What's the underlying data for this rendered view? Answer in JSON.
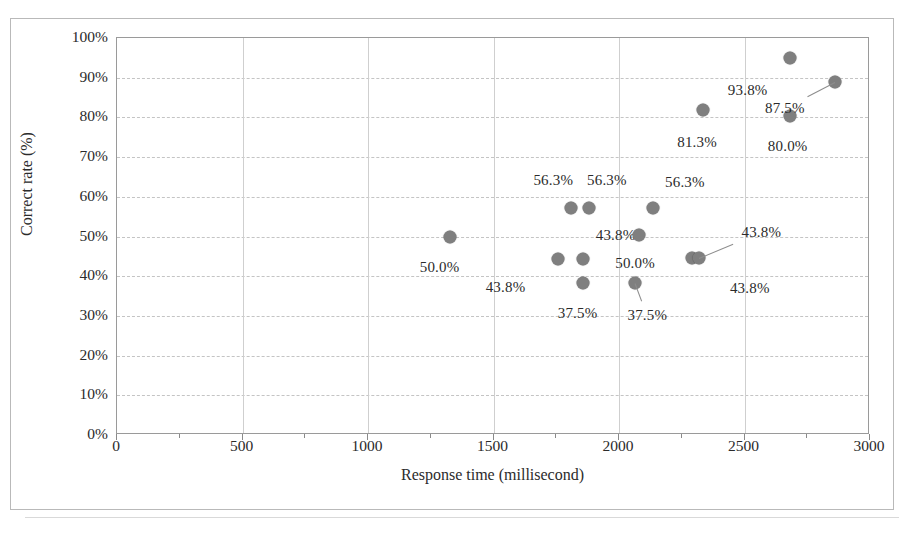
{
  "chart_data": {
    "type": "scatter",
    "title": "",
    "xlabel": "Response time (millisecond)",
    "ylabel": "Correct rate (%)",
    "xlim": [
      0,
      3000
    ],
    "ylim": [
      0,
      1.0
    ],
    "xticks": [
      "0",
      "500",
      "1000",
      "1500",
      "2000",
      "2500",
      "3000"
    ],
    "yticks": [
      "0%",
      "10%",
      "20%",
      "30%",
      "40%",
      "50%",
      "60%",
      "70%",
      "80%",
      "90%",
      "100%"
    ],
    "grid": true,
    "legend": "none",
    "marker_color": "#7f7f7f",
    "points": [
      {
        "x": 1325,
        "y": 50.0,
        "label": "50.0%",
        "label_dx": -10,
        "label_dy": 30,
        "leader": false
      },
      {
        "x": 1755,
        "y": 44.4,
        "label": "43.8%",
        "label_dx": -52,
        "label_dy": 28,
        "leader": false
      },
      {
        "x": 1810,
        "y": 57.3,
        "label": "56.3%",
        "label_dx": -18,
        "label_dy": -28,
        "leader": false
      },
      {
        "x": 1880,
        "y": 57.3,
        "label": "56.3%",
        "label_dx": 18,
        "label_dy": -28,
        "leader": false
      },
      {
        "x": 1855,
        "y": 44.4,
        "label": "43.8%",
        "label_dx": 33,
        "label_dy": -24,
        "leader": false
      },
      {
        "x": 1855,
        "y": 38.3,
        "label": "37.5%",
        "label_dx": -5,
        "label_dy": 30,
        "leader": false
      },
      {
        "x": 2065,
        "y": 38.3,
        "label": "37.5%",
        "label_dx": 12,
        "label_dy": 32,
        "leader": true
      },
      {
        "x": 2080,
        "y": 50.5,
        "label": "50.0%",
        "label_dx": -4,
        "label_dy": 28,
        "leader": false
      },
      {
        "x": 2135,
        "y": 57.3,
        "label": "56.3%",
        "label_dx": 32,
        "label_dy": -26,
        "leader": false
      },
      {
        "x": 2290,
        "y": 44.7,
        "label": "43.8%",
        "label_dx": 58,
        "label_dy": 30,
        "leader": false
      },
      {
        "x": 2320,
        "y": 44.7,
        "label": "43.8%",
        "label_dx": 62,
        "label_dy": -26,
        "leader": true
      },
      {
        "x": 2335,
        "y": 81.8,
        "label": "81.3%",
        "label_dx": -6,
        "label_dy": 32,
        "leader": false
      },
      {
        "x": 2680,
        "y": 95.0,
        "label": "93.8%",
        "label_dx": -42,
        "label_dy": 32,
        "leader": false
      },
      {
        "x": 2680,
        "y": 80.3,
        "label": "80.0%",
        "label_dx": -2,
        "label_dy": 30,
        "leader": false
      },
      {
        "x": 2860,
        "y": 89.0,
        "label": "87.5%",
        "label_dx": -50,
        "label_dy": 26,
        "leader": true
      }
    ]
  }
}
